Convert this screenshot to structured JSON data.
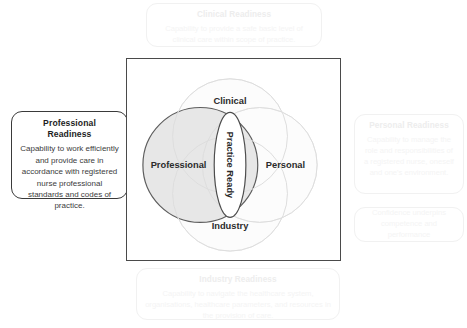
{
  "diagram": {
    "frame_border_color": "#4a4a4a",
    "highlight_color": "#3a3a3a",
    "faded_color": "#f0f0f0",
    "center": {
      "label": "Practice Ready"
    },
    "circles": [
      {
        "key": "professional",
        "label": "Professional",
        "position": "left",
        "state": "highlighted",
        "fill": "#e3e3e3",
        "stroke": "#5a5a5a"
      },
      {
        "key": "clinical",
        "label": "Clinical",
        "position": "top",
        "state": "faded",
        "fill": "#fafafa",
        "stroke": "#e6e6e6"
      },
      {
        "key": "industry",
        "label": "Industry",
        "position": "bottom",
        "state": "faded",
        "fill": "#fafafa",
        "stroke": "#e6e6e6"
      },
      {
        "key": "personal",
        "label": "Personal",
        "position": "right",
        "state": "faded",
        "fill": "#fafafa",
        "stroke": "#e6e6e6"
      }
    ]
  },
  "callouts": {
    "clinical": {
      "title": "Clinical Readiness",
      "body": "Capability to provide a safe basic level of clinical care within scope of practice."
    },
    "professional": {
      "title": "Professional Readiness",
      "body": "Capability to work efficiently and provide care in accordance with registered nurse professional standards and codes of practice."
    },
    "personal": {
      "title": "Personal Readiness",
      "body": "Capability to manage the role and responsibilities of a registered nurse, oneself and one's environment."
    },
    "confidence": {
      "body": "Confidence underpins competence and performance"
    },
    "industry": {
      "title": "Industry Readiness",
      "body": "Capability to navigate the healthcare system, organisations, healthcare parameters, and resources in the provision of care."
    }
  }
}
